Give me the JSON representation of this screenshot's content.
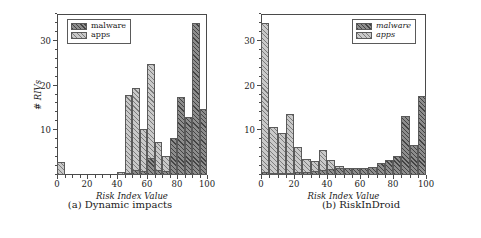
{
  "figure": {
    "panels": [
      {
        "key": "a",
        "caption": "(a) Dynamic impacts",
        "legend": [
          {
            "name": "malware",
            "label": "malware",
            "style": "malware"
          },
          {
            "name": "apps",
            "label": "apps",
            "style": "apps"
          }
        ]
      },
      {
        "key": "b",
        "caption": "(b) RiskInDroid",
        "legend": [
          {
            "name": "malware",
            "label": "malware",
            "style": "malware"
          },
          {
            "name": "apps",
            "label": "apps",
            "style": "apps"
          }
        ]
      }
    ]
  },
  "chart_data": [
    {
      "type": "bar",
      "id": "dynamic-impacts",
      "title": "(a) Dynamic impacts",
      "xlabel": "Risk Index Value",
      "ylabel": "# RIVs",
      "xlim": [
        0,
        100
      ],
      "ylim": [
        0,
        36
      ],
      "xticks": [
        0,
        20,
        40,
        60,
        80,
        100
      ],
      "yticks": [
        10,
        20,
        30
      ],
      "grid": false,
      "legend_position": "top-left",
      "bin_width": 5,
      "bin_starts": [
        0,
        5,
        10,
        15,
        20,
        25,
        30,
        35,
        40,
        45,
        50,
        55,
        60,
        65,
        70,
        75,
        80,
        85,
        90,
        95
      ],
      "series": [
        {
          "name": "apps",
          "color": "#c9c9c9",
          "values": [
            3.0,
            0,
            0,
            0,
            0,
            0,
            0,
            0,
            0.6,
            17.8,
            19.5,
            10.4,
            24.8,
            7.4,
            4.3,
            3.9,
            3.2,
            2.4,
            1.1,
            0
          ]
        },
        {
          "name": "malware",
          "color": "#8d8d8d",
          "values": [
            0,
            0,
            0,
            0,
            0,
            0,
            0,
            0,
            0,
            0.5,
            1.1,
            0.8,
            3.8,
            1.2,
            0.9,
            8.2,
            17.4,
            13.0,
            34.0,
            14.8
          ]
        }
      ]
    },
    {
      "type": "bar",
      "id": "riskindroid",
      "title": "(b) RiskInDroid",
      "xlabel": "Risk Index Value",
      "ylabel": "# RIVs",
      "xlim": [
        0,
        100
      ],
      "ylim": [
        0,
        36
      ],
      "xticks": [
        0,
        20,
        40,
        60,
        80,
        100
      ],
      "yticks": [
        10,
        20,
        30
      ],
      "grid": false,
      "legend_position": "top-right",
      "bin_width": 5,
      "bin_starts": [
        0,
        5,
        10,
        15,
        20,
        25,
        30,
        35,
        40,
        45,
        50,
        55,
        60,
        65,
        70,
        75,
        80,
        85,
        90,
        95
      ],
      "series": [
        {
          "name": "apps",
          "color": "#c9c9c9",
          "values": [
            34.0,
            10.8,
            9.3,
            13.6,
            6.2,
            3.5,
            3.2,
            5.6,
            3.3,
            2.1,
            1.6,
            1.5,
            1.4,
            1.8,
            2.6,
            3.0,
            2.2,
            1.4,
            1.0,
            0.8
          ]
        },
        {
          "name": "malware",
          "color": "#8d8d8d",
          "values": [
            0.6,
            0.5,
            0.5,
            0.5,
            0.6,
            0.7,
            0.9,
            1.1,
            1.3,
            1.5,
            1.6,
            1.6,
            1.5,
            1.8,
            2.6,
            3.4,
            4.3,
            13.2,
            6.8,
            17.6,
            34.3
          ]
        }
      ]
    }
  ]
}
